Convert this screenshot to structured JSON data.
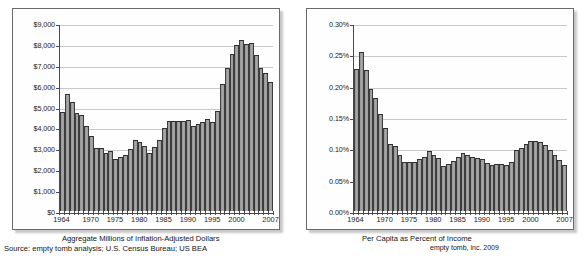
{
  "chart_data": [
    {
      "type": "bar",
      "id": "aggregate-dollars",
      "title": "Aggregate Millions of Inflation-Adjusted Dollars",
      "source": "Source: empty tomb analysis; U.S. Census Bureau; US BEA",
      "xlabel": "",
      "ylabel": "",
      "ylim": [
        0,
        9000
      ],
      "ytick_values": [
        0,
        1000,
        2000,
        3000,
        4000,
        5000,
        6000,
        7000,
        8000,
        9000
      ],
      "ytick_labels": [
        "$0",
        "$1,000",
        "$2,000",
        "$3,000",
        "$4,000",
        "$5,000",
        "$6,000",
        "$7,000",
        "$8,000",
        "$9,000"
      ],
      "grid": true,
      "legend": "none",
      "xtick_labels": [
        "1964",
        "1970",
        "1975",
        "1980",
        "1985",
        "1990",
        "1995",
        "2000",
        "2007"
      ],
      "xtick_years": [
        1964,
        1970,
        1975,
        1980,
        1985,
        1990,
        1995,
        2000,
        2007
      ],
      "categories": [
        1964,
        1965,
        1966,
        1967,
        1968,
        1969,
        1970,
        1971,
        1972,
        1973,
        1974,
        1975,
        1976,
        1977,
        1978,
        1979,
        1980,
        1981,
        1982,
        1983,
        1984,
        1985,
        1986,
        1987,
        1988,
        1989,
        1990,
        1991,
        1992,
        1993,
        1994,
        1995,
        1996,
        1997,
        1998,
        1999,
        2000,
        2001,
        2002,
        2003,
        2004,
        2005,
        2006,
        2007
      ],
      "values": [
        4720,
        5600,
        5200,
        4680,
        4580,
        4050,
        3580,
        3020,
        3010,
        2800,
        2870,
        2480,
        2580,
        2670,
        2960,
        3400,
        3320,
        3130,
        2790,
        3070,
        3420,
        3980,
        4320,
        4320,
        4300,
        4300,
        4340,
        4070,
        4150,
        4280,
        4420,
        4280,
        4780,
        6060,
        6860,
        7500,
        7950,
        8180,
        8000,
        8040,
        7450,
        6850,
        6630,
        6180
      ],
      "bar_fill": "#9b9b9b",
      "bar_edge": "#333333"
    },
    {
      "type": "bar",
      "id": "per-capita-percent",
      "title": "Per Capita as Percent of Income",
      "credit": "empty tomb, inc. 2009",
      "xlabel": "",
      "ylabel": "",
      "ylim": [
        0,
        0.3
      ],
      "ytick_values": [
        0.0,
        0.05,
        0.1,
        0.15,
        0.2,
        0.25,
        0.3
      ],
      "ytick_labels": [
        "0.00%",
        "0.05%",
        "0.10%",
        "0.15%",
        "0.20%",
        "0.25%",
        "0.30%"
      ],
      "grid": true,
      "legend": "none",
      "xtick_labels": [
        "1964",
        "1970",
        "1975",
        "1980",
        "1985",
        "1990",
        "1995",
        "2000",
        "2007"
      ],
      "xtick_years": [
        1964,
        1970,
        1975,
        1980,
        1985,
        1990,
        1995,
        2000,
        2007
      ],
      "categories": [
        1964,
        1965,
        1966,
        1967,
        1968,
        1969,
        1970,
        1971,
        1972,
        1973,
        1974,
        1975,
        1976,
        1977,
        1978,
        1979,
        1980,
        1981,
        1982,
        1983,
        1984,
        1985,
        1986,
        1987,
        1988,
        1989,
        1990,
        1991,
        1992,
        1993,
        1994,
        1995,
        1996,
        1997,
        1998,
        1999,
        2000,
        2001,
        2002,
        2003,
        2004,
        2005,
        2006,
        2007
      ],
      "values": [
        0.226,
        0.253,
        0.225,
        0.194,
        0.181,
        0.155,
        0.133,
        0.107,
        0.104,
        0.089,
        0.079,
        0.079,
        0.079,
        0.083,
        0.086,
        0.095,
        0.09,
        0.085,
        0.072,
        0.075,
        0.08,
        0.086,
        0.092,
        0.089,
        0.086,
        0.084,
        0.083,
        0.077,
        0.074,
        0.075,
        0.075,
        0.074,
        0.079,
        0.097,
        0.1,
        0.107,
        0.111,
        0.112,
        0.11,
        0.105,
        0.098,
        0.089,
        0.082,
        0.073
      ],
      "bar_fill": "#9b9b9b",
      "bar_edge": "#333333"
    }
  ]
}
